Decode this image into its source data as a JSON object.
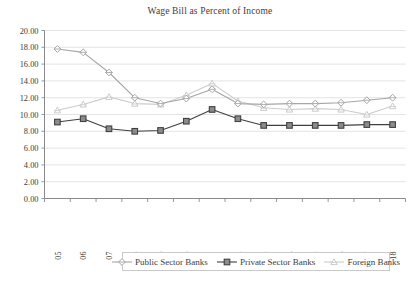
{
  "chart_data": {
    "type": "line",
    "title": "Wage Bill as Percent of Income",
    "xlabel": "",
    "ylabel": "",
    "ylim": [
      0,
      20
    ],
    "ytick_step": 2,
    "grid": true,
    "legend_position": "bottom",
    "categories": [
      "2004/05",
      "2005/06",
      "2006/07",
      "2007/08",
      "2008/09",
      "2009/10",
      "2010/11",
      "2011/12",
      "2012/13",
      "2013/14",
      "2014/15",
      "2015/16",
      "2016/17",
      "2017/18"
    ],
    "ytick_labels": [
      "0.00",
      "2.00",
      "4.00",
      "6.00",
      "8.00",
      "10.00",
      "12.00",
      "14.00",
      "16.00",
      "18.00",
      "20.00"
    ],
    "ytick_values": [
      0,
      2,
      4,
      6,
      8,
      10,
      12,
      14,
      16,
      18,
      20
    ],
    "series": [
      {
        "name": "Public Sector Banks",
        "color": "#a6a6a6",
        "marker": "diamond",
        "values": [
          17.8,
          17.4,
          15.0,
          12.0,
          11.3,
          11.9,
          13.0,
          11.3,
          11.2,
          11.3,
          11.3,
          11.4,
          11.7,
          12.0
        ]
      },
      {
        "name": "Private Sector Banks",
        "color": "#404040",
        "marker": "square",
        "values": [
          9.1,
          9.5,
          8.3,
          8.0,
          8.1,
          9.2,
          10.6,
          9.5,
          8.7,
          8.7,
          8.7,
          8.7,
          8.8,
          8.8
        ]
      },
      {
        "name": "Foreign Banks",
        "color": "#cccccc",
        "marker": "triangle",
        "values": [
          10.5,
          11.2,
          12.1,
          11.3,
          11.2,
          12.3,
          13.7,
          11.6,
          10.8,
          10.6,
          10.7,
          10.6,
          10.0,
          11.0
        ]
      }
    ]
  },
  "legend": {
    "entries": [
      {
        "label": "Public Sector Banks"
      },
      {
        "label": "Private Sector Banks"
      },
      {
        "label": "Foreign Banks"
      }
    ]
  }
}
